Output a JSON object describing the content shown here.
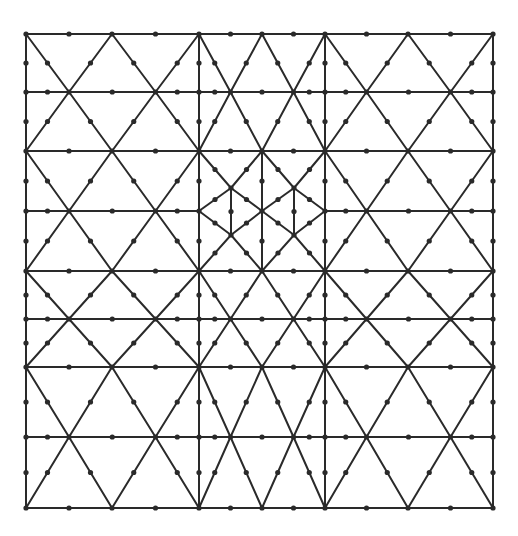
{
  "diagram": {
    "type": "triangular-finite-element-mesh",
    "stroke_color": "#2a2a2a",
    "node_color": "#2a2a2a",
    "background": "#ffffff",
    "columns_x": [
      [
        26,
        112,
        199
      ],
      [
        199,
        262,
        325
      ],
      [
        325,
        408,
        493
      ]
    ],
    "major_rows_y": [
      34,
      151,
      271,
      367,
      508
    ],
    "mid_rows_y": [
      92,
      211,
      319,
      437
    ],
    "refined_band": {
      "row_index": 1,
      "column_index": 1,
      "points": {
        "left": [
          199,
          211
        ],
        "upper_left": [
          231,
          188
        ],
        "lower_left": [
          231,
          235
        ],
        "center": [
          262,
          211
        ],
        "upper_right": [
          294,
          188
        ],
        "lower_right": [
          294,
          235
        ],
        "right": [
          325,
          211
        ],
        "top": [
          262,
          151
        ],
        "bottom": [
          262,
          271
        ],
        "top_left": [
          199,
          151
        ],
        "top_right": [
          325,
          151
        ],
        "bottom_left": [
          199,
          271
        ],
        "bottom_right": [
          325,
          271
        ]
      }
    }
  }
}
